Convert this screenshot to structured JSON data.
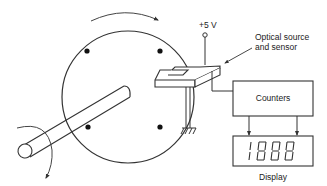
{
  "diagram": {
    "labels": {
      "supply": "+5 V",
      "sensor_line1": "Optical source",
      "sensor_line2": "and sensor",
      "counters": "Counters",
      "display": "Display",
      "display_readout": "1888"
    },
    "components": [
      {
        "id": "disk",
        "type": "rotating disk with 4 holes"
      },
      {
        "id": "shaft",
        "type": "shaft"
      },
      {
        "id": "sensor",
        "type": "optical source and sensor (U-shaped)"
      },
      {
        "id": "supply",
        "type": "+5 V terminal"
      },
      {
        "id": "ground",
        "type": "ground symbol"
      },
      {
        "id": "counters",
        "type": "counter block"
      },
      {
        "id": "display",
        "type": "7-segment display"
      }
    ],
    "colors": {
      "line": "#333333",
      "text": "#222222",
      "background": "#ffffff"
    }
  }
}
